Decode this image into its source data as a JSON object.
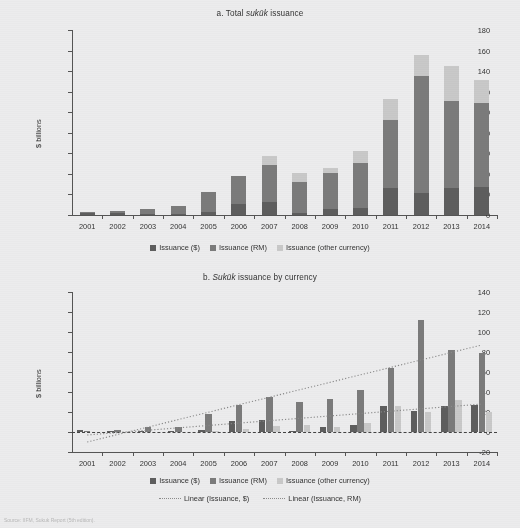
{
  "figure": {
    "background": "#ececed",
    "source_note": "Source: IIFM, Sukuk Report (5th edition)."
  },
  "colors": {
    "usd": "#5e5e5e",
    "rm": "#7b7b7b",
    "other": "#c9c9c9",
    "trend": "#8a8a8a",
    "axis": "#555555"
  },
  "legend": {
    "usd": "Issuance ($)",
    "rm": "Issuance (RM)",
    "other": "Issuance (other currency)",
    "trend_usd": "Linear (Issuance, $)",
    "trend_rm": "Linear (Issuance, RM)"
  },
  "chart_data": [
    {
      "id": "chart-a",
      "type": "bar",
      "stacked": true,
      "title": "a. Total sukūk issuance",
      "title_prefix": "a. Total ",
      "title_italic": "sukūk",
      "title_suffix": " issuance",
      "xlabel": "",
      "ylabel": "$ billions",
      "ylim": [
        0,
        180
      ],
      "yticks": [
        0,
        20,
        40,
        60,
        80,
        100,
        120,
        140,
        160,
        180
      ],
      "grid": false,
      "legend_position": "bottom",
      "categories": [
        "2001",
        "2002",
        "2003",
        "2004",
        "2005",
        "2006",
        "2007",
        "2008",
        "2009",
        "2010",
        "2011",
        "2012",
        "2013",
        "2014"
      ],
      "series": [
        {
          "name": "Issuance ($)",
          "key": "usd",
          "values": [
            2.0,
            1.5,
            1.0,
            1.0,
            2.5,
            11.0,
            12.5,
            1.5,
            5.5,
            7.0,
            26.0,
            21.0,
            26.0,
            27.0
          ]
        },
        {
          "name": "Issuance (RM)",
          "key": "rm",
          "values": [
            1.0,
            2.0,
            5.0,
            8.0,
            19.5,
            27.0,
            36.5,
            30.5,
            35.0,
            44.0,
            66.5,
            114.0,
            85.0,
            82.0
          ]
        },
        {
          "name": "Issuance (other currency)",
          "key": "other",
          "values": [
            0.0,
            0.0,
            0.0,
            0.0,
            0.0,
            0.0,
            8.0,
            8.5,
            5.5,
            11.0,
            20.0,
            21.0,
            34.0,
            22.0
          ]
        }
      ],
      "totals": [
        3,
        3.5,
        6,
        9,
        22,
        38,
        57,
        40.5,
        46,
        62,
        112.5,
        156,
        145,
        131
      ]
    },
    {
      "id": "chart-b",
      "type": "bar",
      "stacked": false,
      "title": "b. Sukūk issuance by currency",
      "title_prefix": "b. ",
      "title_italic": "Sukūk",
      "title_suffix": " issuance by currency",
      "xlabel": "",
      "ylabel": "$ billions",
      "ylim": [
        -20,
        140
      ],
      "yticks": [
        -20,
        0,
        20,
        40,
        60,
        80,
        100,
        120,
        140
      ],
      "grid": false,
      "legend_position": "bottom",
      "categories": [
        "2001",
        "2002",
        "2003",
        "2004",
        "2005",
        "2006",
        "2007",
        "2008",
        "2009",
        "2010",
        "2011",
        "2012",
        "2013",
        "2014"
      ],
      "series": [
        {
          "name": "Issuance ($)",
          "key": "usd",
          "values": [
            2.0,
            1.5,
            1.0,
            1.0,
            2.5,
            11.0,
            12.5,
            1.5,
            5.5,
            7.0,
            26.0,
            21.0,
            26.0,
            27.0
          ]
        },
        {
          "name": "Issuance (RM)",
          "key": "rm",
          "values": [
            1.0,
            2.0,
            5.0,
            5.0,
            18.5,
            27.0,
            35.5,
            30.0,
            33.5,
            42.0,
            64.5,
            112.0,
            82.5,
            79.0
          ]
        },
        {
          "name": "Issuance (other currency)",
          "key": "other",
          "values": [
            0.0,
            0.0,
            0.0,
            0.0,
            0.5,
            3.5,
            6.5,
            7.5,
            5.5,
            9.0,
            26.5,
            20.0,
            32.0,
            20.5
          ]
        }
      ],
      "trendlines": [
        {
          "name": "Linear (Issuance, $)",
          "key": "trend_usd",
          "x0_value": -10.0,
          "x1_value": 87.0
        },
        {
          "name": "Linear (Issuance, RM)",
          "key": "trend_rm",
          "x0_value": -3.0,
          "x1_value": 28.0
        }
      ],
      "zero_reference_line": true
    }
  ]
}
